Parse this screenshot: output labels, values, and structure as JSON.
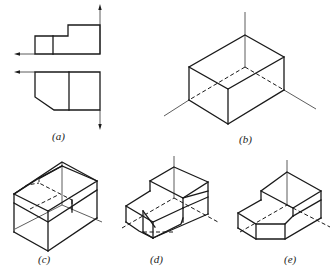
{
  "figure": {
    "panels": [
      {
        "id": "a",
        "label": "(a)",
        "kind": "orthographic views (front and top) with projection axes"
      },
      {
        "id": "b",
        "label": "(b)",
        "kind": "isometric bounding box with axes"
      },
      {
        "id": "c",
        "label": "(c)",
        "kind": "isometric box with step cut outlined (dashed)"
      },
      {
        "id": "d",
        "label": "(d)",
        "kind": "isometric stepped block with chamfer outlined (dashed)"
      },
      {
        "id": "e",
        "label": "(e)",
        "kind": "isometric finished stepped block with chamfered corner"
      }
    ]
  },
  "colors": {
    "line": "#1a1a1a",
    "background": "#ffffff"
  }
}
